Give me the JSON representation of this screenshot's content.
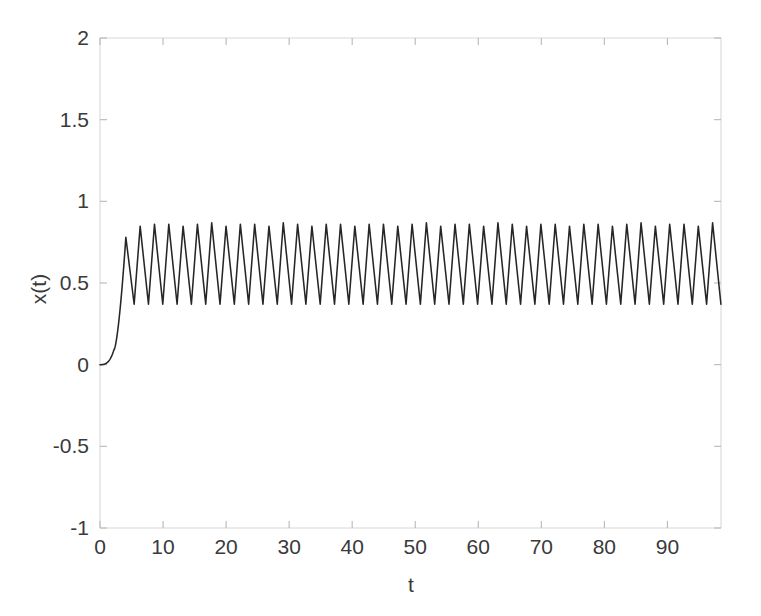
{
  "chart_data": {
    "type": "line",
    "title": "",
    "xlabel": "t",
    "ylabel": "x(t)",
    "xlim": [
      0,
      98.5
    ],
    "ylim": [
      -1,
      2
    ],
    "xticks": [
      0,
      10,
      20,
      30,
      40,
      50,
      60,
      70,
      80,
      90
    ],
    "xtick_labels": [
      "0",
      "10",
      "20",
      "30",
      "40",
      "50",
      "60",
      "70",
      "80",
      "90"
    ],
    "yticks": [
      -1,
      -0.5,
      0,
      0.5,
      1,
      1.5,
      2
    ],
    "ytick_labels": [
      "-1",
      "-0.5",
      "0",
      "0.5",
      "1",
      "1.5",
      "2"
    ],
    "grid": false,
    "legend": null,
    "line_color": "#262626",
    "axis_color": "#d8d8d8",
    "background_color": "#ffffff",
    "series": [
      {
        "name": "x(t)",
        "description": "relaxation oscillation: quiescent start at 0, slow rise to t=2, steep jump to first peak near t=4, then sustained sawtooth limit cycle",
        "transient": {
          "t_start": 0.0,
          "x_start": 0.0,
          "slow_rise_end_t": 2.2,
          "slow_rise_end_x": 0.09,
          "first_peak_t": 4.1,
          "first_peak_x": 0.78
        },
        "limit_cycle": {
          "period": 2.27,
          "peak": 0.86,
          "trough": 0.37,
          "peak_phase_fraction": 0.42,
          "onset_t": 4.1,
          "t_end": 98.5,
          "approx_cycle_count": 42
        },
        "points": [
          {
            "t": 0.0,
            "x": 0.0
          },
          {
            "t": 0.6,
            "x": 0.005
          },
          {
            "t": 1.2,
            "x": 0.02
          },
          {
            "t": 1.8,
            "x": 0.05
          },
          {
            "t": 2.3,
            "x": 0.11
          },
          {
            "t": 2.8,
            "x": 0.24
          },
          {
            "t": 3.2,
            "x": 0.4
          },
          {
            "t": 3.6,
            "x": 0.58
          },
          {
            "t": 4.1,
            "x": 0.78
          },
          {
            "t": 5.0,
            "x": 0.46
          },
          {
            "t": 5.5,
            "x": 0.38
          },
          {
            "t": 6.3,
            "x": 0.86
          },
          {
            "t": 7.3,
            "x": 0.4
          },
          {
            "t": 7.8,
            "x": 0.37
          },
          {
            "t": 8.6,
            "x": 0.85
          },
          {
            "t": 9.6,
            "x": 0.4
          },
          {
            "t": 10.0,
            "x": 0.37
          },
          {
            "t": 10.8,
            "x": 0.86
          },
          {
            "t": 98.5,
            "x": 0.37
          }
        ]
      }
    ]
  },
  "axes": {
    "ylabel_text": "x(t)",
    "xlabel_text": "t"
  }
}
